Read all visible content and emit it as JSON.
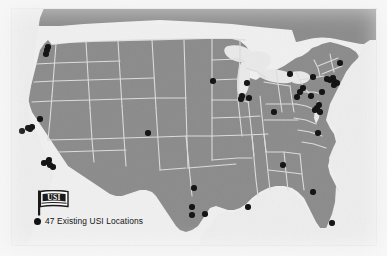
{
  "figure": {
    "kind": "locator-map",
    "region": "Continental United States",
    "background_color": "#f3f3f3",
    "land_fill": "#8d8d8d",
    "state_border_color": "#e2e2e2",
    "water_fill": "#ececec",
    "dot_color": "#111111",
    "dot_count": 47
  },
  "legend": {
    "logo_name": "usi-flag-logo",
    "logo_text": "USI",
    "marker_name": "legend-location-dot",
    "label": "47 Existing USI Locations"
  },
  "chart_data": {
    "type": "scatter",
    "title": "47 Existing USI Locations",
    "xlabel": "",
    "ylabel": "",
    "grid": false,
    "legend_position": "bottom-left",
    "series": [
      {
        "name": "47 Existing USI Locations",
        "marker": "filled-circle",
        "color": "#111111",
        "count": 47,
        "points": [
          {
            "x": 48,
            "y": 47
          },
          {
            "x": 46,
            "y": 54
          },
          {
            "x": 22,
            "y": 131
          },
          {
            "x": 28,
            "y": 128
          },
          {
            "x": 32,
            "y": 127
          },
          {
            "x": 40,
            "y": 119
          },
          {
            "x": 44,
            "y": 163
          },
          {
            "x": 48,
            "y": 162
          },
          {
            "x": 50,
            "y": 165
          },
          {
            "x": 53,
            "y": 167
          },
          {
            "x": 148,
            "y": 133
          },
          {
            "x": 213,
            "y": 81
          },
          {
            "x": 242,
            "y": 96
          },
          {
            "x": 247,
            "y": 83
          },
          {
            "x": 249,
            "y": 98
          },
          {
            "x": 274,
            "y": 112
          },
          {
            "x": 290,
            "y": 74
          },
          {
            "x": 297,
            "y": 97
          },
          {
            "x": 303,
            "y": 88
          },
          {
            "x": 311,
            "y": 96
          },
          {
            "x": 315,
            "y": 110
          },
          {
            "x": 317,
            "y": 108
          },
          {
            "x": 320,
            "y": 112
          },
          {
            "x": 313,
            "y": 77
          },
          {
            "x": 327,
            "y": 79
          },
          {
            "x": 330,
            "y": 80
          },
          {
            "x": 333,
            "y": 78
          },
          {
            "x": 335,
            "y": 82
          },
          {
            "x": 337,
            "y": 83
          },
          {
            "x": 340,
            "y": 63
          },
          {
            "x": 322,
            "y": 92
          },
          {
            "x": 318,
            "y": 133
          },
          {
            "x": 283,
            "y": 165
          },
          {
            "x": 313,
            "y": 192
          },
          {
            "x": 332,
            "y": 223
          },
          {
            "x": 248,
            "y": 207
          },
          {
            "x": 194,
            "y": 188
          },
          {
            "x": 192,
            "y": 207
          },
          {
            "x": 192,
            "y": 215
          },
          {
            "x": 205,
            "y": 214
          },
          {
            "x": 241,
            "y": 99
          },
          {
            "x": 300,
            "y": 92
          },
          {
            "x": 319,
            "y": 105
          },
          {
            "x": 334,
            "y": 85
          },
          {
            "x": 49,
            "y": 160
          },
          {
            "x": 30,
            "y": 129
          },
          {
            "x": 47,
            "y": 50
          }
        ]
      }
    ]
  }
}
